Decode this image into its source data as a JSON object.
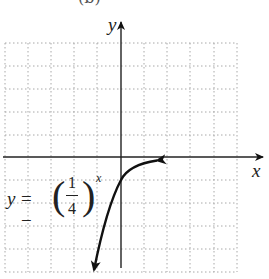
{
  "figure": {
    "caption": "(b)",
    "x_axis_label": "x",
    "y_axis_label": "y",
    "equation": {
      "lhs": "y",
      "equals": "= −",
      "left_paren": "(",
      "right_paren": ")",
      "numerator": "1",
      "denominator": "4",
      "exponent": "x",
      "full_text": "y = −(1/4)^x"
    },
    "grid": {
      "x_range": [
        -5,
        5
      ],
      "y_range": [
        -5,
        5
      ],
      "step": 1,
      "style": "dotted",
      "color": "#b0b0b0"
    },
    "curve": {
      "function": "y = -(1/4)^x",
      "color": "#111111",
      "points": [
        [
          -1.23,
          -5.5
        ],
        [
          -1,
          -4
        ],
        [
          -0.5,
          -2
        ],
        [
          0,
          -1
        ],
        [
          0.5,
          -0.5
        ],
        [
          1,
          -0.25
        ],
        [
          1.5,
          -0.125
        ]
      ],
      "arrows": "both ends"
    }
  }
}
